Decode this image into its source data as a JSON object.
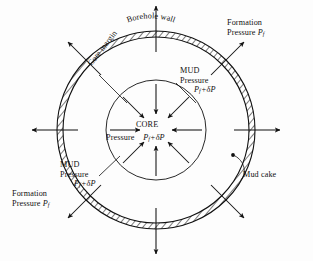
{
  "figure": {
    "background_color": "#fdfdfd",
    "line_color": "#111111"
  },
  "geometry": {
    "center_x": 156,
    "center_y": 130,
    "outer_ring_outer_radius": 99,
    "outer_ring_inner_radius": 93,
    "core_radius": 50,
    "outward_arrow_tip_radius": 124,
    "outward_arrow_tail_radius": 78,
    "inward_arrow_tail_radius": 46,
    "inward_arrow_tip_radius": 16
  },
  "labels": {
    "borehole_wall": "Borehole  wall",
    "core_margin": "Core  margin",
    "mud_cake": "Mud cake",
    "core_title": "CORE",
    "core_pressure_word": "Pressure",
    "core_pressure_value_P": "P",
    "core_pressure_value_sub": "f",
    "core_pressure_value_rest": "+δP",
    "mud_pressure_line1": "MUD",
    "mud_pressure_line2": "Pressure",
    "mud_pressure_P": "P",
    "mud_pressure_sub": "f",
    "mud_pressure_rest": "+δP",
    "formation_line1": "Formation",
    "formation_line2": "Pressure ",
    "formation_P": "P",
    "formation_sub": "f"
  },
  "annotations": {
    "outward_arrow_count": 8,
    "inward_arrow_count": 8,
    "outward_arrow_meaning": "Formation Pressure Pf",
    "inward_arrow_meaning": "MUD Pressure Pf+δP",
    "ring_fill": "diagonal-hatch",
    "ring_meaning": "Mud cake annulus"
  }
}
